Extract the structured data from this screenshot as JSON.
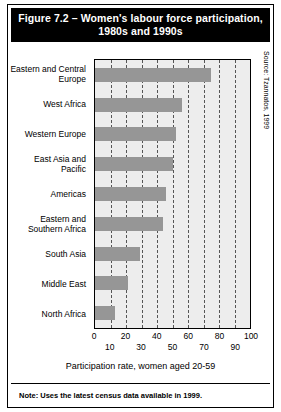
{
  "figure": {
    "title": "Figure 7.2 – Women's labour force participation, 1980s and 1990s",
    "source": "Source: Tzannatos, 1999",
    "note": "Note: Uses the latest census data available in 1999."
  },
  "chart_data": {
    "type": "bar",
    "orientation": "horizontal",
    "title": "Figure 7.2 – Women's labour force participation, 1980s and 1990s",
    "categories": [
      "Eastern and Central Europe",
      "West Africa",
      "Western Europe",
      "East Asia and Pacific",
      "Americas",
      "Eastern and Southern Africa",
      "South Asia",
      "Middle East",
      "North Africa"
    ],
    "values": [
      75,
      56,
      52,
      50,
      46,
      44,
      29,
      21,
      13
    ],
    "xlabel": "Participation rate, women aged 20-59",
    "ylabel": "",
    "xlim": [
      0,
      100
    ],
    "xticks": [
      0,
      10,
      20,
      30,
      40,
      50,
      60,
      70,
      80,
      90,
      100
    ],
    "xtick_labels": [
      "0",
      "10",
      "20",
      "30",
      "40",
      "50",
      "60",
      "70",
      "80",
      "90",
      "100"
    ],
    "grid": true,
    "gridline_style": "dashed",
    "gridline_values": [
      10,
      20,
      30,
      40,
      50,
      60,
      70,
      80,
      90
    ],
    "legend": null,
    "bar_color": "#969696",
    "plot_background": "#ededed",
    "title_background": "#000000",
    "title_color": "#ffffff"
  }
}
